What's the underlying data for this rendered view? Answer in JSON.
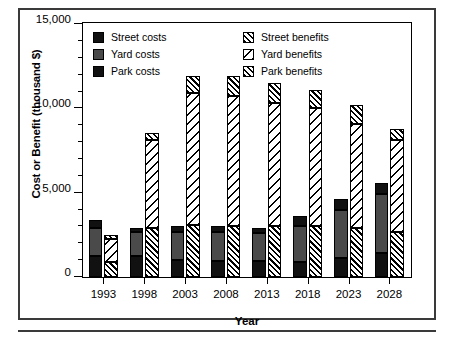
{
  "figure": {
    "y_axis_title": "Cost or Benefit (thousand $)",
    "x_axis_title": "Year"
  },
  "legend": {
    "costs": [
      {
        "label": "Street costs",
        "swatch": "solid-black-square-icon",
        "fill_class": "fill-street-cost",
        "color": "#111111"
      },
      {
        "label": "Yard costs",
        "swatch": "solid-gray-square-icon",
        "fill_class": "fill-yard-cost",
        "color": "#4a4a4a"
      },
      {
        "label": "Park costs",
        "swatch": "solid-black-square-icon",
        "fill_class": "fill-park-cost",
        "color": "#111111"
      }
    ],
    "benefits": [
      {
        "label": "Street benefits",
        "swatch": "dense-forward-hatch-square-icon",
        "fill_class": "fill-street-benefit",
        "color": "#000000"
      },
      {
        "label": "Yard benefits",
        "swatch": "sparse-back-hatch-square-icon",
        "fill_class": "fill-yard-benefit",
        "color": "#000000"
      },
      {
        "label": "Park benefits",
        "swatch": "dense-forward-hatch-square-icon",
        "fill_class": "fill-park-benefit",
        "color": "#000000"
      }
    ]
  },
  "chart_data": {
    "type": "bar",
    "subtype": "grouped-stacked",
    "title": "",
    "xlabel": "Year",
    "ylabel": "Cost or Benefit (thousand $)",
    "categories": [
      "1993",
      "1998",
      "2003",
      "2008",
      "2013",
      "2018",
      "2023",
      "2028"
    ],
    "ylim": [
      0,
      15000
    ],
    "ytick_major": [
      0,
      5000,
      10000,
      15000
    ],
    "ytick_major_labels": [
      "0",
      "5,000",
      "10,000",
      "15,000"
    ],
    "ytick_minor_step": 1000,
    "grid": false,
    "legend_position": "inside-top",
    "groups": [
      {
        "name": "Costs",
        "series": [
          {
            "name": "Street costs",
            "values": [
              1250,
              1250,
              1000,
              950,
              950,
              900,
              1150,
              1400
            ]
          },
          {
            "name": "Yard costs",
            "values": [
              1650,
              1400,
              1700,
              1750,
              1650,
              2100,
              2800,
              3550
            ]
          },
          {
            "name": "Park costs",
            "values": [
              500,
              250,
              300,
              300,
              300,
              600,
              650,
              650
            ]
          }
        ],
        "totals": [
          3400,
          2900,
          3000,
          3000,
          2900,
          3600,
          4600,
          5600
        ]
      },
      {
        "name": "Benefits",
        "series": [
          {
            "name": "Street benefits",
            "values": [
              900,
              2900,
              3100,
              3050,
              3000,
              3000,
              2900,
              2700
            ]
          },
          {
            "name": "Yard benefits",
            "values": [
              1350,
              5250,
              7800,
              7700,
              7350,
              7050,
              6200,
              5450
            ]
          },
          {
            "name": "Park benefits",
            "values": [
              250,
              400,
              1000,
              1200,
              1150,
              1050,
              1100,
              650
            ]
          }
        ],
        "totals": [
          2500,
          8550,
          11900,
          11950,
          11500,
          11100,
          10200,
          8800
        ]
      }
    ]
  }
}
